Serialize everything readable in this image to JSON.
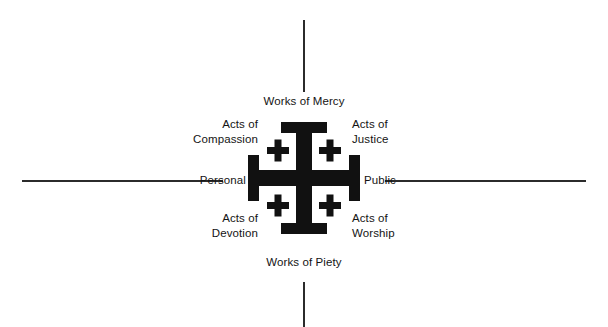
{
  "figure": {
    "type": "diagram",
    "name": "jerusalem-cross-works-of-mercy-and-piety",
    "cutoff_caption": "",
    "background_color": "#ffffff",
    "ink_color": "#141414",
    "axis_color": "#2b2b2b"
  },
  "labels": {
    "top": "Works of Mercy",
    "bottom": "Works of Piety",
    "left": "Personal",
    "right": "Public",
    "top_left": "Acts of\nCompassion",
    "top_right": "Acts of\nJustice",
    "bottom_left": "Acts of\nDevotion",
    "bottom_right": "Acts of\nWorship"
  },
  "axes": {
    "vertical_top": "vertical-axis-line-top",
    "vertical_bottom": "vertical-axis-line-bottom",
    "horizontal_left": "horizontal-axis-line-left",
    "horizontal_right": "horizontal-axis-line-right"
  },
  "cross": {
    "name": "jerusalem-cross",
    "fill": "#111111",
    "quadrant_crosslets": 4
  }
}
